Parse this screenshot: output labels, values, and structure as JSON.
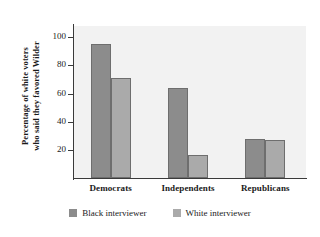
{
  "chart_data": {
    "type": "bar",
    "title": "",
    "subtitle": "",
    "xlabel": "",
    "ylabel": "Percentage of white voters who said they favored Wilder",
    "ylabel_line1": "Percentage of white voters",
    "ylabel_line2": "who said they favored Wilder",
    "categories": [
      "Democrats",
      "Independents",
      "Republicans"
    ],
    "series": [
      {
        "name": "Black interviewer",
        "values": [
          95,
          64,
          28
        ],
        "color": "#8c8c8c"
      },
      {
        "name": "White interviewer",
        "values": [
          71,
          16,
          27
        ],
        "color": "#aaaaaa"
      }
    ],
    "ylim": [
      0,
      108
    ],
    "yticks": [
      20,
      40,
      60,
      80,
      100
    ],
    "ytick_labels": [
      "20",
      "40",
      "60",
      "80",
      "100"
    ],
    "grid": false,
    "legend_position": "bottom",
    "plot_background": "#f2f2f2",
    "axis_color": "#3a3a3a"
  },
  "legend": {
    "items": [
      {
        "label": "Black interviewer",
        "color": "#8c8c8c"
      },
      {
        "label": "White interviewer",
        "color": "#aaaaaa"
      }
    ]
  }
}
